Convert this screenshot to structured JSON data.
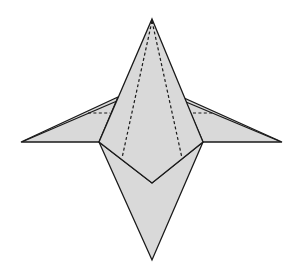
{
  "diagram": {
    "colors": {
      "fill": "#d9d9d9",
      "stroke": "#1a1a1a",
      "background": "#ffffff"
    },
    "points": {
      "top_apex": [
        152,
        19
      ],
      "bottom_apex": [
        152,
        260
      ],
      "center_v": [
        152,
        183
      ],
      "left_junction": [
        99,
        142
      ],
      "right_junction": [
        203,
        142
      ],
      "left_wing_tip": [
        21,
        142
      ],
      "right_wing_tip": [
        282,
        142
      ],
      "left_wing_top": [
        118,
        97
      ],
      "right_wing_top": [
        184,
        98
      ],
      "left_dash_end": [
        122,
        158
      ],
      "right_dash_end": [
        182,
        158
      ]
    },
    "elements": [
      {
        "type": "face",
        "name": "left-wing"
      },
      {
        "type": "face",
        "name": "right-wing"
      },
      {
        "type": "face",
        "name": "bottom-point"
      },
      {
        "type": "face",
        "name": "central-kite"
      },
      {
        "type": "valley-fold",
        "name": "left-center-fold"
      },
      {
        "type": "valley-fold",
        "name": "right-center-fold"
      },
      {
        "type": "valley-fold",
        "name": "left-wing-fold"
      },
      {
        "type": "valley-fold",
        "name": "right-wing-fold"
      }
    ]
  }
}
